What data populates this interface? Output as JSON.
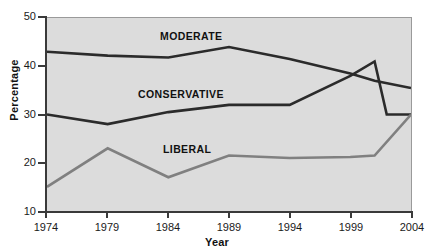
{
  "chart_data": {
    "type": "line",
    "title": "",
    "xlabel": "Year",
    "ylabel": "Percentage",
    "xlim": [
      1974,
      2004
    ],
    "ylim": [
      10,
      50
    ],
    "x_ticks": [
      "1974",
      "1979",
      "1984",
      "1989",
      "1994",
      "1999",
      "2004"
    ],
    "y_ticks": [
      "10",
      "20",
      "30",
      "40",
      "50"
    ],
    "grid": false,
    "legend_position": "inline-labels",
    "series": [
      {
        "name": "MODERATE",
        "color": "#2b2b2b",
        "label_text": "MODERATE",
        "x": [
          1974,
          1979,
          1984,
          1989,
          1994,
          1999,
          2001,
          2004
        ],
        "values": [
          43,
          42.2,
          41.8,
          44,
          41.5,
          38.5,
          37,
          35.5
        ]
      },
      {
        "name": "CONSERVATIVE",
        "color": "#2b2b2b",
        "label_text": "CONSERVATIVE",
        "x": [
          1974,
          1979,
          1984,
          1989,
          1994,
          1999,
          2001,
          2002,
          2004
        ],
        "values": [
          30,
          28,
          30.5,
          32,
          32,
          38,
          41,
          30,
          30
        ]
      },
      {
        "name": "LIBERAL",
        "color": "#808080",
        "label_text": "LIBERAL",
        "x": [
          1974,
          1979,
          1984,
          1989,
          1994,
          1999,
          2001,
          2004
        ],
        "values": [
          15,
          23,
          17,
          21.5,
          21,
          21.2,
          21.5,
          30
        ]
      }
    ]
  }
}
